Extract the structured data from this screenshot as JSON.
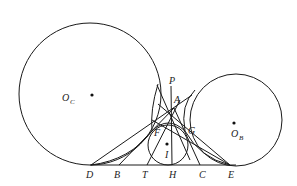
{
  "diagram": {
    "type": "geometry",
    "circles": [
      {
        "name": "O_C",
        "cx": 90,
        "cy": 94,
        "r": 71,
        "label_main": "O",
        "label_sub": "C",
        "label_x": 62,
        "label_y": 100
      },
      {
        "name": "O_B",
        "cx": 236,
        "cy": 120,
        "r": 46,
        "label_main": "O",
        "label_sub": "B",
        "label_x": 231,
        "label_y": 136
      },
      {
        "name": "I",
        "cx": 168,
        "cy": 145,
        "r": 21,
        "label_main": "I",
        "label_sub": "",
        "label_x": 165,
        "label_y": 158
      }
    ],
    "points": {
      "P": {
        "x": 171,
        "y": 86,
        "lx": 169,
        "ly": 84
      },
      "A": {
        "x": 174,
        "y": 108,
        "lx": 174,
        "ly": 103
      },
      "F": {
        "x": 152,
        "y": 131,
        "lx": 154,
        "ly": 136
      },
      "G": {
        "x": 185,
        "y": 131,
        "lx": 188,
        "ly": 134
      },
      "D": {
        "x": 91,
        "y": 165,
        "lx": 86,
        "ly": 178
      },
      "B": {
        "x": 119,
        "y": 165,
        "lx": 114,
        "ly": 178
      },
      "T": {
        "x": 147,
        "y": 165,
        "lx": 142,
        "ly": 178
      },
      "H": {
        "x": 172,
        "y": 165,
        "lx": 169,
        "ly": 178
      },
      "C": {
        "x": 200,
        "y": 165,
        "lx": 199,
        "ly": 178
      },
      "E": {
        "x": 230,
        "y": 165,
        "lx": 228,
        "ly": 178
      }
    },
    "labels": [
      "P",
      "A",
      "F",
      "G",
      "D",
      "B",
      "T",
      "H",
      "C",
      "E",
      "O_C",
      "O_B",
      "I"
    ]
  }
}
